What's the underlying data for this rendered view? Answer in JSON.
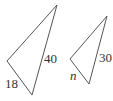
{
  "diagram": {
    "triangles": [
      {
        "name": "large-triangle",
        "vertices": [
          [
            57,
            5
          ],
          [
            7,
            61
          ],
          [
            32,
            95
          ]
        ],
        "labels": {
          "long_side": "40",
          "short_side": "18"
        }
      },
      {
        "name": "small-triangle",
        "vertices": [
          [
            107,
            16
          ],
          [
            70,
            59
          ],
          [
            89,
            84
          ]
        ],
        "labels": {
          "long_side": "30",
          "short_side": "n"
        }
      }
    ],
    "stroke_color": "#555555"
  }
}
